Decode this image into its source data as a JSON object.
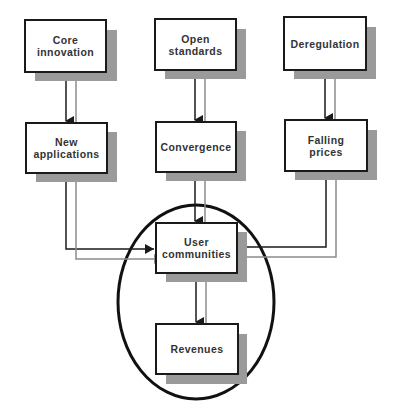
{
  "diagram": {
    "colors": {
      "border": "#1a1a1a",
      "shadow": "#9a9a9a",
      "primary_arrow": "#1a1a1a",
      "secondary_arrow": "#8c8c8c",
      "ellipse": "#111111",
      "text": "#333333"
    },
    "nodes": {
      "core_innovation": {
        "label": "Core\ninnovation"
      },
      "open_standards": {
        "label": "Open\nstandards"
      },
      "deregulation": {
        "label": "Deregulation"
      },
      "new_applications": {
        "label": "New\napplications"
      },
      "convergence": {
        "label": "Convergence"
      },
      "falling_prices": {
        "label": "Falling\nprices"
      },
      "user_communities": {
        "label": "User\ncommunities"
      },
      "revenues": {
        "label": "Revenues"
      }
    },
    "edges": [
      {
        "from": "Core innovation",
        "to": "New applications"
      },
      {
        "from": "Open standards",
        "to": "Convergence"
      },
      {
        "from": "Deregulation",
        "to": "Falling prices"
      },
      {
        "from": "New applications",
        "to": "User communities"
      },
      {
        "from": "Convergence",
        "to": "User communities"
      },
      {
        "from": "Falling prices",
        "to": "User communities"
      },
      {
        "from": "User communities",
        "to": "Revenues"
      }
    ],
    "highlight": {
      "shape": "ellipse",
      "encloses": [
        "User communities",
        "Revenues"
      ]
    }
  }
}
